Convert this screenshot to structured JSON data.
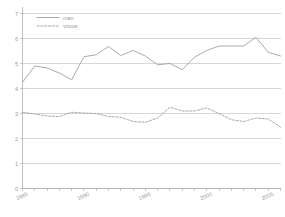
{
  "chart_data": {
    "type": "line",
    "title": "",
    "xlabel": "",
    "ylabel": "",
    "x": [
      1985,
      1986,
      1987,
      1988,
      1989,
      1990,
      1991,
      1992,
      1993,
      1994,
      1995,
      1996,
      1997,
      1998,
      1999,
      2000,
      2001,
      2002,
      2003,
      2004,
      2005,
      2006
    ],
    "xlim": [
      1985,
      2006
    ],
    "ylim": [
      0,
      7
    ],
    "yticks": [
      0,
      1,
      2,
      3,
      4,
      5,
      6,
      7
    ],
    "xticks": [
      1985,
      1990,
      1995,
      2000,
      2005
    ],
    "xtick_labels": [
      "1985",
      "1990",
      "1995",
      "2000",
      "2005"
    ],
    "ytick_labels": [
      "0",
      "1",
      "2",
      "3",
      "4",
      "5",
      "6",
      "7"
    ],
    "grid": "horizontal",
    "legend_position": "top-left",
    "series": [
      {
        "name": "man",
        "style": "solid",
        "color": "#9b9b9b",
        "values": [
          4.25,
          4.9,
          4.82,
          4.62,
          4.35,
          5.27,
          5.35,
          5.68,
          5.32,
          5.52,
          5.3,
          4.95,
          5.0,
          4.75,
          5.25,
          5.52,
          5.7,
          5.7,
          5.7,
          6.05,
          5.45,
          5.3
        ]
      },
      {
        "name": "vrouw",
        "style": "dashed",
        "color": "#9b9b9b",
        "values": [
          3.05,
          2.98,
          2.9,
          2.88,
          3.05,
          3.02,
          3.0,
          2.88,
          2.85,
          2.68,
          2.65,
          2.82,
          3.25,
          3.1,
          3.1,
          3.22,
          3.0,
          2.75,
          2.68,
          2.82,
          2.78,
          2.45
        ]
      }
    ]
  }
}
